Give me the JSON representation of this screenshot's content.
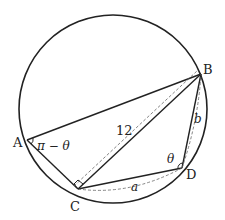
{
  "figure": {
    "type": "inscribed-quadrilateral-diagram",
    "points": {
      "A": {
        "label": "A"
      },
      "B": {
        "label": "B"
      },
      "C": {
        "label": "C"
      },
      "D": {
        "label": "D"
      }
    },
    "labels": {
      "diagonal_BC": "12",
      "angle_A": "π − θ",
      "angle_D": "θ",
      "side_BD": "b",
      "side_CD": "a"
    },
    "annotations": {
      "right_angle_at": "C"
    },
    "colors": {
      "stroke": "#222222",
      "dashed": "#666666",
      "background": "#ffffff"
    }
  }
}
